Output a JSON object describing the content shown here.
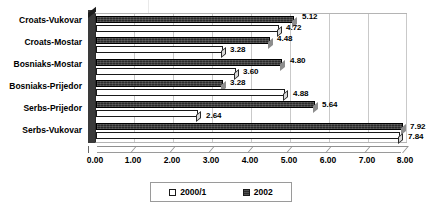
{
  "chart_data": {
    "type": "bar",
    "orientation": "horizontal",
    "title": "",
    "subtitle": "",
    "xlabel": "",
    "ylabel": "",
    "xlim": [
      0.0,
      8.0
    ],
    "xticks": [
      "0.00",
      "1.00",
      "2.00",
      "3.00",
      "4.00",
      "5.00",
      "6.00",
      "7.00",
      "8.00"
    ],
    "tick_interval": 1.0,
    "grid": true,
    "grid_axis": "x",
    "legend_position": "bottom",
    "style": "3d-excel-horizontal-bar",
    "categories": [
      "Croats-Vukovar",
      "Croats-Mostar",
      "Bosniaks-Mostar",
      "Bosniaks-Prijedor",
      "Serbs-Prijedor",
      "Serbs-Vukovar"
    ],
    "series": [
      {
        "name": "2000/1",
        "swatch": "white",
        "color": "#ffffff",
        "values": [
          4.72,
          3.28,
          3.6,
          4.88,
          2.64,
          7.84
        ],
        "labels": [
          "4.72",
          "3.28",
          "3.60",
          "4.88",
          "2.64",
          "7.84"
        ]
      },
      {
        "name": "2002",
        "swatch": "dark",
        "color": "#2b2b2b",
        "values": [
          5.12,
          4.48,
          4.8,
          3.28,
          5.64,
          7.92
        ],
        "labels": [
          "5.12",
          "4.48",
          "4.80",
          "3.28",
          "5.64",
          "7.92"
        ]
      }
    ]
  },
  "legend": {
    "items": [
      {
        "label": "2000/1"
      },
      {
        "label": "2002"
      }
    ]
  },
  "colors": {
    "series_2000_1": "#ffffff",
    "series_2002": "#2b2b2b",
    "gridline": "#c9c9c9",
    "axis": "#8f8f8f",
    "text": "#000000",
    "background": "#ffffff"
  }
}
